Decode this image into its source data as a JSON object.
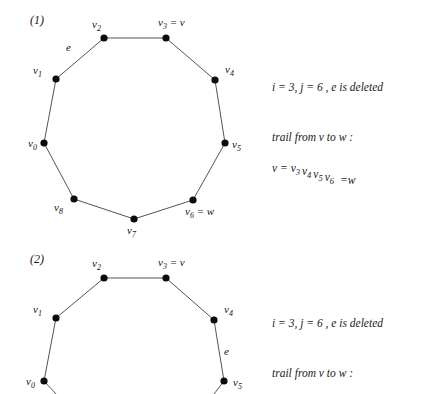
{
  "figure": {
    "background_color": "#ffffff",
    "node_color": "#0b0b0b",
    "edge_color": "#55555a",
    "text_color": "#141414"
  },
  "panels": [
    {
      "id": "panel-1",
      "label": "(1)",
      "label_pos": {
        "x": 30,
        "y": 24
      },
      "shape": "closed-cycle",
      "edge_label": {
        "text": "e",
        "x": 66,
        "y": 51
      },
      "nodes": [
        {
          "id": "v0",
          "base": "v",
          "sub": "0",
          "extra": "",
          "x": 44,
          "y": 143,
          "label_x": 28,
          "label_y": 147
        },
        {
          "id": "v1",
          "base": "v",
          "sub": "1",
          "extra": "",
          "x": 56,
          "y": 79,
          "label_x": 33,
          "label_y": 74
        },
        {
          "id": "v2",
          "base": "v",
          "sub": "2",
          "extra": "",
          "x": 104,
          "y": 38,
          "label_x": 92,
          "label_y": 28
        },
        {
          "id": "v3",
          "base": "v",
          "sub": "3",
          "extra": " = v",
          "x": 166,
          "y": 38,
          "label_x": 158,
          "label_y": 26
        },
        {
          "id": "v4",
          "base": "v",
          "sub": "4",
          "extra": "",
          "x": 215,
          "y": 80,
          "label_x": 225,
          "label_y": 73
        },
        {
          "id": "v5",
          "base": "v",
          "sub": "5",
          "extra": "",
          "x": 225,
          "y": 143,
          "label_x": 232,
          "label_y": 148
        },
        {
          "id": "v6",
          "base": "v",
          "sub": "6",
          "extra": " = w",
          "x": 193,
          "y": 200,
          "label_x": 185,
          "label_y": 215
        },
        {
          "id": "v7",
          "base": "v",
          "sub": "7",
          "extra": "",
          "x": 134,
          "y": 219,
          "label_x": 127,
          "label_y": 234
        },
        {
          "id": "v8",
          "base": "v",
          "sub": "8",
          "extra": "",
          "x": 74,
          "y": 199,
          "label_x": 54,
          "label_y": 211
        }
      ],
      "edges": [
        [
          "v0",
          "v1"
        ],
        [
          "v1",
          "v2"
        ],
        [
          "v2",
          "v3"
        ],
        [
          "v3",
          "v4"
        ],
        [
          "v4",
          "v5"
        ],
        [
          "v5",
          "v6"
        ],
        [
          "v6",
          "v7"
        ],
        [
          "v7",
          "v8"
        ],
        [
          "v8",
          "v0"
        ]
      ],
      "notes": [
        {
          "id": "note-1-1",
          "text": "i = 3, j = 6 , e  is deleted",
          "x": 272,
          "y": 91
        },
        {
          "id": "note-1-2",
          "text": "trail from v to w :",
          "x": 272,
          "y": 141
        },
        {
          "id": "note-1-3",
          "text": "",
          "x": 272,
          "y": 172,
          "rich": true
        }
      ],
      "trail": {
        "prefix": "v = ",
        "vertices": [
          {
            "base": "v",
            "sub": "3"
          },
          {
            "base": "v",
            "sub": "4"
          },
          {
            "base": "v",
            "sub": "5"
          },
          {
            "base": "v",
            "sub": "6"
          }
        ],
        "suffix": "=w"
      }
    },
    {
      "id": "panel-2",
      "label": "(2)",
      "label_pos": {
        "x": 30,
        "y": 263
      },
      "shape": "open-arc",
      "edge_label": {
        "text": "e",
        "x": 224,
        "y": 355
      },
      "nodes": [
        {
          "id": "v0",
          "base": "v",
          "sub": "0",
          "extra": "",
          "x": 44,
          "y": 381,
          "label_x": 26,
          "label_y": 385
        },
        {
          "id": "v1",
          "base": "v",
          "sub": "1",
          "extra": "",
          "x": 56,
          "y": 318,
          "label_x": 33,
          "label_y": 313
        },
        {
          "id": "v2",
          "base": "v",
          "sub": "2",
          "extra": "",
          "x": 104,
          "y": 278,
          "label_x": 92,
          "label_y": 267
        },
        {
          "id": "v3",
          "base": "v",
          "sub": "3",
          "extra": " = v",
          "x": 166,
          "y": 278,
          "label_x": 158,
          "label_y": 266
        },
        {
          "id": "v4",
          "base": "v",
          "sub": "4",
          "extra": "",
          "x": 214,
          "y": 320,
          "label_x": 224,
          "label_y": 313
        },
        {
          "id": "v5",
          "base": "v",
          "sub": "5",
          "extra": "",
          "x": 224,
          "y": 381,
          "label_x": 233,
          "label_y": 386
        }
      ],
      "edges": [
        [
          "v0",
          "v1"
        ],
        [
          "v1",
          "v2"
        ],
        [
          "v2",
          "v3"
        ],
        [
          "v3",
          "v4"
        ],
        [
          "v4",
          "v5"
        ]
      ],
      "stubs": [
        {
          "id": "stub-v0",
          "x1": 44,
          "y1": 381,
          "x2": 56,
          "y2": 394
        },
        {
          "id": "stub-v5",
          "x1": 224,
          "y1": 381,
          "x2": 214,
          "y2": 394
        }
      ],
      "notes": [
        {
          "id": "note-2-1",
          "text": "i = 3, j = 6 , e  is deleted",
          "x": 272,
          "y": 327
        },
        {
          "id": "note-2-2",
          "text": "trail from v to w :",
          "x": 272,
          "y": 377
        }
      ]
    }
  ]
}
